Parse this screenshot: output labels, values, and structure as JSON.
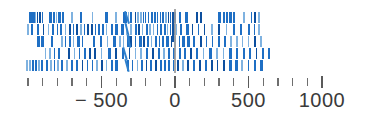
{
  "chart_data": {
    "type": "strip",
    "title": "",
    "xlabel": "",
    "ylabel": "",
    "xlim": [
      -1050,
      1060
    ],
    "grid": false,
    "legend": null,
    "axis": {
      "major_ticks": [
        -500,
        0,
        500,
        1000
      ],
      "major_tick_labels": [
        "− 500",
        "0",
        "500",
        "1000"
      ],
      "minor_ticks": [
        -1000,
        -900,
        -800,
        -700,
        -600,
        -400,
        -300,
        -200,
        -100,
        100,
        200,
        300,
        400,
        600,
        700,
        800,
        900
      ],
      "tick_direction": "up"
    },
    "reference_lines": [
      {
        "value": 0,
        "color": "#9a9a9a",
        "style": "solid"
      }
    ],
    "marker_color": "#1f6fc4",
    "rows": [
      {
        "name": "row-1",
        "values": [
          -985,
          -965,
          -950,
          -935,
          -920,
          -900,
          -855,
          -840,
          -825,
          -805,
          -790,
          -760,
          -700,
          -640,
          -560,
          -470,
          -400,
          -345,
          -330,
          -315,
          -300,
          -270,
          -250,
          -230,
          -215,
          -200,
          -180,
          -160,
          -140,
          -120,
          -100,
          -80,
          -60,
          -45,
          -30,
          -15,
          -5,
          30,
          75,
          150,
          175,
          300,
          330,
          350,
          375,
          400,
          470,
          520,
          545,
          570
        ]
      },
      {
        "name": "row-2",
        "values": [
          -1000,
          -975,
          -930,
          -895,
          -860,
          -830,
          -800,
          -775,
          -745,
          -715,
          -690,
          -665,
          -640,
          -615,
          -590,
          -565,
          -540,
          -515,
          -490,
          -465,
          -430,
          -400,
          -360,
          -330,
          -300,
          -270,
          -245,
          -220,
          -195,
          -170,
          -145,
          -120,
          -95,
          -70,
          -50,
          -30,
          -10,
          10,
          40,
          80,
          120,
          160,
          200,
          250,
          300,
          350,
          400,
          450,
          500,
          540,
          570
        ]
      },
      {
        "name": "row-3",
        "values": [
          -930,
          -905,
          -835,
          -770,
          -745,
          -715,
          -690,
          -660,
          -630,
          -555,
          -505,
          -460,
          -415,
          -375,
          -350,
          -320,
          -300,
          -270,
          -240,
          -210,
          -185,
          -160,
          -130,
          -105,
          -80,
          -55,
          -25,
          0,
          30,
          55,
          90,
          130,
          175,
          215,
          255,
          300,
          340,
          380,
          420,
          460,
          500,
          545,
          585
        ]
      },
      {
        "name": "row-4",
        "values": [
          -880,
          -850,
          -820,
          -790,
          -720,
          -685,
          -650,
          -615,
          -580,
          -545,
          -500,
          -450,
          -400,
          -355,
          -310,
          -270,
          -230,
          -190,
          -150,
          -110,
          -75,
          -40,
          -5,
          30,
          70,
          110,
          150,
          195,
          240,
          285,
          330,
          375,
          420,
          465,
          510,
          555,
          600,
          640
        ]
      },
      {
        "name": "row-5",
        "values": [
          -1005,
          -985,
          -965,
          -945,
          -925,
          -905,
          -870,
          -845,
          -820,
          -795,
          -770,
          -735,
          -700,
          -665,
          -630,
          -595,
          -560,
          -530,
          -495,
          -465,
          -430,
          -400,
          -320,
          -290,
          -255,
          -225,
          -195,
          -165,
          -130,
          -100,
          -70,
          -40,
          -10,
          20,
          55,
          90,
          130,
          170,
          210,
          250,
          290,
          335,
          375,
          415,
          455,
          500,
          545,
          585
        ]
      }
    ],
    "slant_segments": [
      {
        "row": 0,
        "value": -335,
        "angle": -18
      },
      {
        "row": 1,
        "value": -330,
        "angle": -14
      },
      {
        "row": 2,
        "value": -322,
        "angle": -12
      },
      {
        "row": 3,
        "value": -348,
        "angle": -16
      },
      {
        "row": 4,
        "value": -330,
        "angle": -15
      }
    ]
  }
}
